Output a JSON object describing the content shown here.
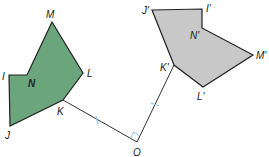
{
  "figure": {
    "colors": {
      "original_fill": "#6aa57c",
      "image_fill": "#c8c8c8",
      "stroke": "#222222",
      "tick_mark": "#8ec8e8",
      "right_angle_mark": "#8ec8e8"
    },
    "original": {
      "name": "IJKLMN",
      "vertices": [
        {
          "label": "M",
          "x": 52,
          "y": 22,
          "lx": 46,
          "ly": 18
        },
        {
          "label": "L",
          "x": 83,
          "y": 73,
          "lx": 87,
          "ly": 77
        },
        {
          "label": "K",
          "x": 63,
          "y": 100,
          "lx": 57,
          "ly": 115
        },
        {
          "label": "J",
          "x": 10,
          "y": 126,
          "lx": 5,
          "ly": 139
        },
        {
          "label": "I",
          "x": 9,
          "y": 75,
          "lx": 2,
          "ly": 80
        },
        {
          "label": "N",
          "x": 27,
          "y": 75,
          "lx": 28,
          "ly": 87
        }
      ]
    },
    "image": {
      "name": "I'J'K'L'M'N'",
      "vertices": [
        {
          "label": "J'",
          "x": 152,
          "y": 10,
          "lx": 142,
          "ly": 14
        },
        {
          "label": "I'",
          "x": 202,
          "y": 9,
          "lx": 206,
          "ly": 12
        },
        {
          "label": "N'",
          "x": 202,
          "y": 28,
          "lx": 190,
          "ly": 39
        },
        {
          "label": "M'",
          "x": 253,
          "y": 55,
          "lx": 256,
          "ly": 59
        },
        {
          "label": "L'",
          "x": 203,
          "y": 87,
          "lx": 197,
          "ly": 100
        },
        {
          "label": "K'",
          "x": 174,
          "y": 65,
          "lx": 160,
          "ly": 71
        }
      ]
    },
    "center": {
      "label": "O",
      "x": 137,
      "y": 142,
      "lx": 133,
      "ly": 156
    },
    "segments": [
      {
        "name": "OK",
        "from": "O",
        "to": "K"
      },
      {
        "name": "OK'",
        "from": "O",
        "to": "K'"
      }
    ],
    "congruence_marks": 1,
    "right_angle_at": "O"
  }
}
